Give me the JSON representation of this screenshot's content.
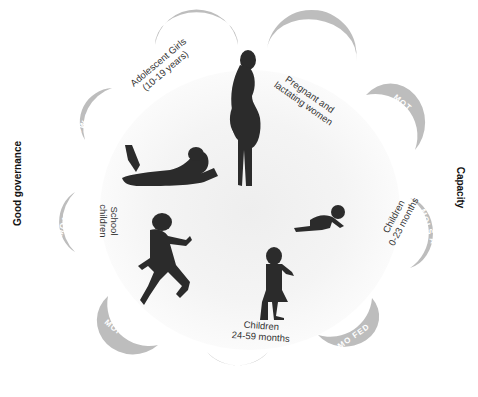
{
  "side_labels": {
    "left": "Good governance",
    "right": "Capacity"
  },
  "ministries": [
    {
      "id": "moh",
      "label": "MOH"
    },
    {
      "id": "moe",
      "label": "MO E"
    },
    {
      "id": "mot",
      "label": "MOT"
    },
    {
      "id": "mols",
      "label": "MOLS A"
    },
    {
      "id": "mofed",
      "label": "MO FED"
    },
    {
      "id": "mowe",
      "label": "MO WE"
    },
    {
      "id": "moi",
      "label": "MOI"
    },
    {
      "id": "moa",
      "label": "MOA"
    },
    {
      "id": "mowcya",
      "label": "MOW CYA"
    }
  ],
  "groups": [
    {
      "id": "adolescent",
      "line1": "Adolescent Girls",
      "line2": "(10-19 years)"
    },
    {
      "id": "pregnant",
      "line1": "Pregnant and",
      "line2": "lactating women"
    },
    {
      "id": "children023",
      "line1": "Children",
      "line2": "0-23 months"
    },
    {
      "id": "children2459",
      "line1": "Children",
      "line2": "24-59 months"
    },
    {
      "id": "school",
      "line1": "School",
      "line2": "children"
    }
  ],
  "colors": {
    "crescent": "#bdbdbd",
    "crescent_text": "#ffffff",
    "silhouette": "#2b2b2b"
  }
}
